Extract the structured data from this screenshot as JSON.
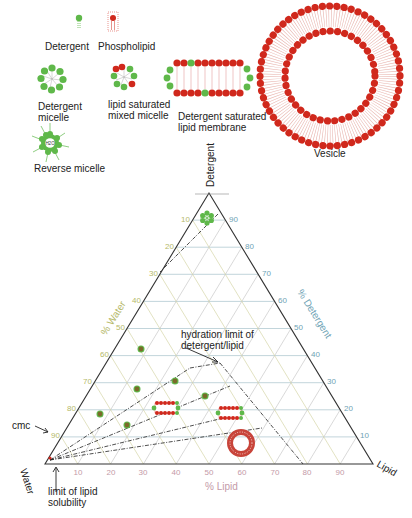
{
  "legend": {
    "detergent": "Detergent",
    "phospholipid": "Phospholipid",
    "detergent_micelle": [
      "Detergent",
      "micelle"
    ],
    "mixed_micelle": [
      "lipid saturated",
      "mixed micelle"
    ],
    "saturated_membrane": [
      "Detergent saturated",
      "lipid membrane"
    ],
    "reverse_micelle": "Reverse micelle",
    "reverse_micelle_core": "H2O",
    "vesicle": "Vesicle"
  },
  "ternary": {
    "vertices": {
      "top": "Detergent",
      "left": "Water",
      "right": "Lipid"
    },
    "axis_titles": {
      "water": "% Water",
      "detergent": "% Detergent",
      "lipid": "% Lipid"
    },
    "water_ticks": [
      "10",
      "20",
      "30",
      "40",
      "50",
      "60",
      "70",
      "80",
      "90"
    ],
    "detergent_ticks": [
      "90",
      "80",
      "70",
      "60",
      "50",
      "40",
      "30",
      "20",
      "10"
    ],
    "lipid_ticks": [
      "10",
      "20",
      "30",
      "40",
      "50",
      "60",
      "70",
      "80",
      "90"
    ],
    "colors": {
      "water": "#b5b96a",
      "detergent": "#6fa3b5",
      "lipid": "#c49aa8",
      "micelle": "#5fb84a",
      "lipid_head": "#d0281c",
      "dot": "#7a7a2a"
    }
  },
  "annotations": {
    "hydration": [
      "hydration limit of",
      "detergent/lipid"
    ],
    "cmc": "cmc",
    "solubility": [
      "limit of lipid",
      "solubility"
    ]
  }
}
